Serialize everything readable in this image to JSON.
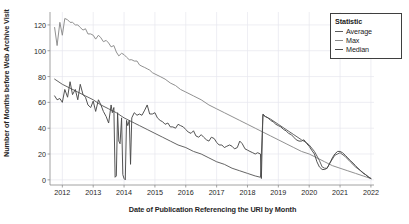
{
  "chart_data": {
    "type": "line",
    "title": "",
    "xlabel": "Date of Publication Referencing the URI by Month",
    "ylabel": "Number of Months before Web Archive Visit",
    "xlim": [
      2011.6,
      2022.1
    ],
    "ylim": [
      -4,
      130
    ],
    "grid": true,
    "legend": {
      "position": "top-right",
      "title": "Statistic",
      "entries": [
        "Average",
        "Max",
        "Median"
      ]
    },
    "xticks": [
      2012,
      2013,
      2014,
      2015,
      2016,
      2017,
      2018,
      2019,
      2020,
      2021,
      2022
    ],
    "xtick_labels": [
      "2012",
      "2013",
      "2014",
      "2015",
      "2016",
      "2017",
      "2018",
      "2019",
      "2020",
      "2021",
      "2022"
    ],
    "yticks": [
      0,
      20,
      40,
      60,
      80,
      100,
      120
    ],
    "ytick_labels": [
      "0",
      "20",
      "40",
      "60",
      "80",
      "100",
      "120"
    ],
    "colors": {
      "Average": "#5c5c5c",
      "Max": "#8a8a8a",
      "Median": "#4a4a4a",
      "grid": "#e6e6ee",
      "axis": "#8c8c8c",
      "text": "#262626"
    },
    "series": [
      {
        "name": "Max",
        "color": "#8a8a8a",
        "x": [
          2011.75,
          2011.83,
          2011.92,
          2012.0,
          2012.08,
          2012.17,
          2012.25,
          2012.33,
          2012.42,
          2012.5,
          2012.58,
          2012.67,
          2012.75,
          2012.83,
          2012.92,
          2013.0,
          2013.08,
          2013.17,
          2013.25,
          2013.33,
          2013.42,
          2013.5,
          2013.58,
          2013.67,
          2013.75,
          2013.83,
          2013.92,
          2014.0,
          2014.08,
          2014.17,
          2014.25,
          2014.33,
          2014.42,
          2014.5,
          2014.58,
          2014.67,
          2014.75,
          2014.83,
          2014.92,
          2015.0,
          2015.17,
          2015.33,
          2015.5,
          2015.67,
          2015.83,
          2016.0,
          2016.25,
          2016.5,
          2016.75,
          2017.0,
          2017.25,
          2017.5,
          2017.75,
          2018.0,
          2018.25,
          2018.5,
          2018.75,
          2019.0,
          2019.25,
          2019.5,
          2019.75,
          2020.0,
          2020.25,
          2020.5,
          2020.75,
          2021.0,
          2021.25,
          2021.5,
          2021.75,
          2022.0
        ],
        "y": [
          118,
          104,
          122,
          112,
          125,
          124,
          122,
          122,
          120,
          120,
          118,
          116,
          117,
          113,
          113,
          112,
          109,
          112,
          110,
          107,
          108,
          106,
          103,
          104,
          99,
          96,
          98,
          97,
          95,
          93,
          93,
          92,
          92,
          89,
          88,
          87,
          86,
          85,
          83,
          82,
          80,
          78,
          75,
          73,
          70,
          68,
          65,
          62,
          58,
          55,
          52,
          49,
          46,
          43,
          40,
          37,
          34,
          31,
          28,
          25,
          22,
          20,
          17,
          14,
          11,
          9,
          7,
          5,
          3,
          1
        ]
      },
      {
        "name": "Average",
        "color": "#5c5c5c",
        "x": [
          2011.75,
          2012.0,
          2012.25,
          2012.5,
          2012.75,
          2013.0,
          2013.25,
          2013.5,
          2013.75,
          2014.0,
          2014.25,
          2014.33,
          2014.5,
          2014.75,
          2015.0,
          2015.25,
          2015.5,
          2015.75,
          2016.0,
          2016.25,
          2016.5,
          2016.75,
          2017.0,
          2017.25,
          2017.5,
          2017.75,
          2018.0,
          2018.25,
          2018.42,
          2018.5,
          2018.58,
          2018.75,
          2019.0,
          2019.25,
          2019.5,
          2019.75,
          2019.9,
          2020.0,
          2020.17,
          2020.33,
          2020.42,
          2020.5,
          2020.58,
          2020.67,
          2020.83,
          2021.0,
          2021.17,
          2021.33,
          2021.5,
          2021.67,
          2021.83,
          2022.0
        ],
        "y": [
          78,
          74,
          71,
          68,
          65,
          62,
          58,
          55,
          52,
          48,
          45,
          44,
          42,
          39,
          36,
          33,
          30,
          27,
          25,
          22,
          20,
          17,
          14,
          12,
          9,
          7,
          5,
          3,
          2,
          50,
          49,
          47,
          43,
          39,
          35,
          31,
          29,
          27,
          22,
          15,
          10,
          9,
          9,
          13,
          19,
          21,
          18,
          14,
          10,
          7,
          4,
          1
        ]
      },
      {
        "name": "Median",
        "color": "#4a4a4a",
        "x": [
          2011.75,
          2011.83,
          2011.92,
          2012.0,
          2012.08,
          2012.17,
          2012.25,
          2012.33,
          2012.42,
          2012.5,
          2012.58,
          2012.67,
          2012.75,
          2012.83,
          2012.92,
          2013.0,
          2013.08,
          2013.17,
          2013.25,
          2013.33,
          2013.42,
          2013.5,
          2013.58,
          2013.62,
          2013.67,
          2013.71,
          2013.75,
          2013.79,
          2013.83,
          2013.87,
          2013.92,
          2013.96,
          2014.0,
          2014.04,
          2014.08,
          2014.12,
          2014.17,
          2014.21,
          2014.25,
          2014.33,
          2014.42,
          2014.5,
          2014.58,
          2014.67,
          2014.75,
          2014.83,
          2014.92,
          2015.0,
          2015.08,
          2015.17,
          2015.25,
          2015.33,
          2015.42,
          2015.5,
          2015.58,
          2015.67,
          2015.75,
          2015.83,
          2015.92,
          2016.0,
          2016.08,
          2016.17,
          2016.25,
          2016.33,
          2016.42,
          2016.5,
          2016.58,
          2016.67,
          2016.75,
          2016.83,
          2016.92,
          2017.0,
          2017.08,
          2017.17,
          2017.25,
          2017.33,
          2017.42,
          2017.5,
          2017.58,
          2017.67,
          2017.75,
          2017.83,
          2017.92,
          2018.0,
          2018.08,
          2018.17,
          2018.25,
          2018.33,
          2018.42,
          2018.45,
          2018.5,
          2018.58,
          2018.67,
          2018.75,
          2018.83,
          2018.92,
          2019.0,
          2019.08,
          2019.17,
          2019.25,
          2019.33,
          2019.42,
          2019.5,
          2019.58,
          2019.67,
          2019.75,
          2019.83,
          2019.92,
          2020.0,
          2020.08,
          2020.17,
          2020.25,
          2020.33,
          2020.42,
          2020.5,
          2020.58,
          2020.67,
          2020.75,
          2020.83,
          2020.92,
          2021.0,
          2021.08,
          2021.17,
          2021.25,
          2021.33,
          2021.42,
          2021.5,
          2021.58,
          2021.67,
          2021.75,
          2021.83,
          2021.92,
          2022.0
        ],
        "y": [
          65,
          62,
          63,
          60,
          70,
          64,
          76,
          66,
          70,
          62,
          74,
          66,
          64,
          58,
          56,
          61,
          53,
          62,
          58,
          53,
          49,
          44,
          58,
          52,
          56,
          2,
          3,
          52,
          30,
          28,
          48,
          4,
          1,
          0,
          46,
          42,
          46,
          12,
          48,
          52,
          50,
          51,
          50,
          54,
          58,
          51,
          51,
          52,
          48,
          46,
          45,
          43,
          44,
          41,
          41,
          40,
          43,
          42,
          41,
          39,
          37,
          36,
          38,
          34,
          33,
          35,
          33,
          31,
          30,
          33,
          32,
          29,
          27,
          27,
          25,
          26,
          27,
          26,
          24,
          25,
          30,
          28,
          24,
          23,
          22,
          21,
          20,
          21,
          20,
          1,
          51,
          49,
          48,
          46,
          45,
          43,
          42,
          41,
          39,
          38,
          36,
          35,
          33,
          31,
          30,
          30,
          31,
          28,
          26,
          23,
          20,
          14,
          10,
          8,
          8,
          9,
          13,
          17,
          20,
          22,
          22,
          21,
          19,
          17,
          15,
          13,
          11,
          9,
          7,
          5,
          4,
          2,
          1
        ]
      }
    ]
  }
}
